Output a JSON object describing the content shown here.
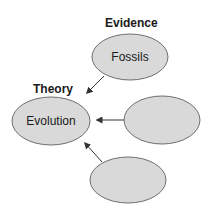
{
  "diagram": {
    "colors": {
      "node_fill": "#d9d9d9",
      "node_stroke": "#6e6e6e",
      "arrow": "#333333",
      "text": "#1a1a1a",
      "background": "#ffffff"
    },
    "headings": {
      "evidence": "Evidence",
      "theory": "Theory"
    },
    "nodes": [
      {
        "id": "evolution",
        "label": "Evolution",
        "role": "theory"
      },
      {
        "id": "fossils",
        "label": "Fossils",
        "role": "evidence"
      },
      {
        "id": "evidence-2",
        "label": "",
        "role": "evidence"
      },
      {
        "id": "evidence-3",
        "label": "",
        "role": "evidence"
      }
    ],
    "edges": [
      {
        "from": "fossils",
        "to": "evolution"
      },
      {
        "from": "evidence-2",
        "to": "evolution"
      },
      {
        "from": "evidence-3",
        "to": "evolution"
      }
    ]
  }
}
